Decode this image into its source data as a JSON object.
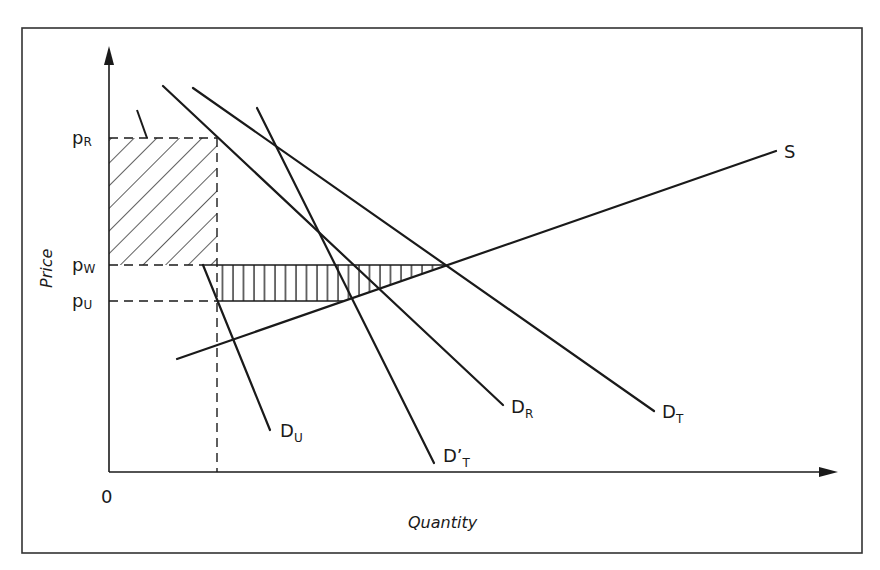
{
  "figure": {
    "type": "supply-demand diagram",
    "frame": {
      "x": 22,
      "y": 28,
      "width": 840,
      "height": 525,
      "stroke": "#333333"
    }
  },
  "axes": {
    "origin_label": "0",
    "x_label": "Quantity",
    "y_label": "Price"
  },
  "price_levels": [
    {
      "id": "pR",
      "main": "p",
      "sub": "R",
      "y": 138
    },
    {
      "id": "pW",
      "main": "p",
      "sub": "W",
      "y": 265
    },
    {
      "id": "pU",
      "main": "p",
      "sub": "U",
      "y": 301
    }
  ],
  "curves": [
    {
      "id": "S",
      "label_main": "S",
      "label_sub": "",
      "x1": 177,
      "y1": 359,
      "x2": 776,
      "y2": 151
    },
    {
      "id": "D_R",
      "label_main": "D",
      "label_sub": "R",
      "x1": 163,
      "y1": 86,
      "x2": 503,
      "y2": 405
    },
    {
      "id": "D_T",
      "label_main": "D",
      "label_sub": "T",
      "x1": 193,
      "y1": 88,
      "x2": 654,
      "y2": 411
    },
    {
      "id": "D_prime_T",
      "label_main": "D’",
      "label_sub": "T",
      "x1": 257,
      "y1": 108,
      "x2": 434,
      "y2": 463
    },
    {
      "id": "D_U",
      "label_main": "D",
      "label_sub": "U",
      "x1": 203,
      "y1": 265,
      "x2": 270,
      "y2": 430
    }
  ],
  "regions": [
    {
      "id": "diagonal-hatched-area",
      "description": "Rectangle between pW and pR from y-axis to dashed quantity line",
      "pattern": "diagonal"
    },
    {
      "id": "vertical-hatched-area",
      "description": "Triangle-like area between pU and pW bounded by D_U and S up to D_T intersection",
      "pattern": "vertical"
    }
  ],
  "colors": {
    "ink": "#1a1a1a",
    "background": "#ffffff"
  }
}
